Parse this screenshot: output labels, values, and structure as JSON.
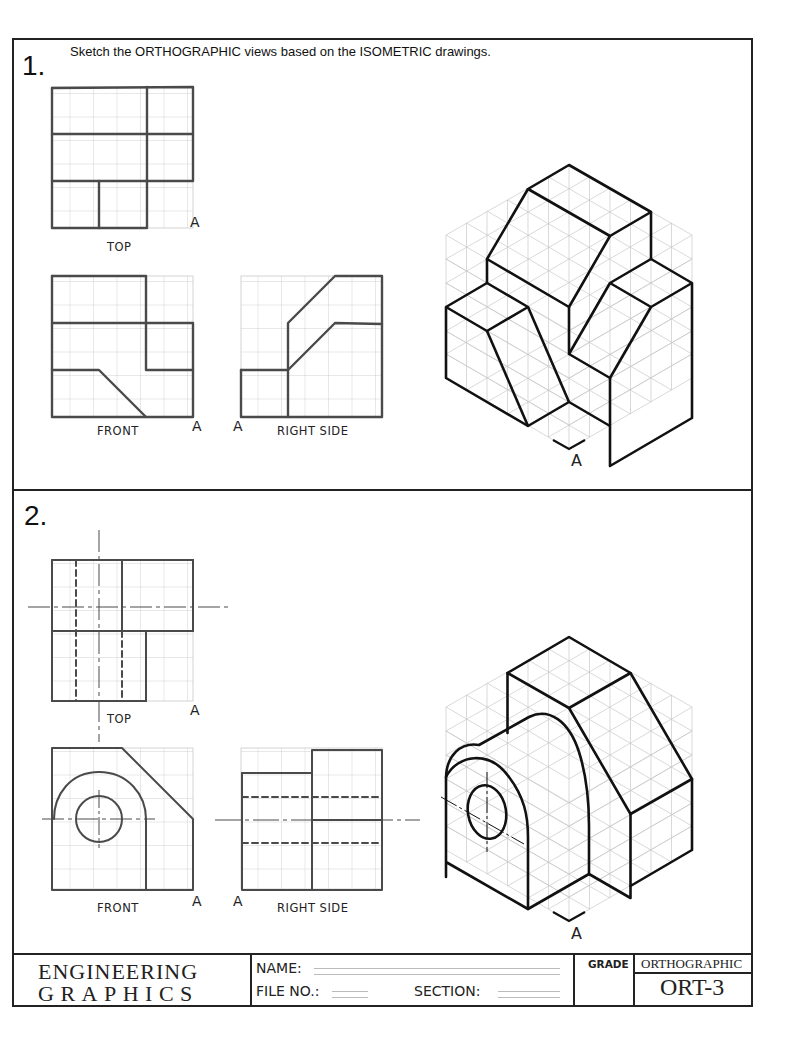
{
  "worksheet": {
    "instructions": "Sketch the ORTHOGRAPHIC views  based on the ISOMETRIC drawings.",
    "problems": [
      {
        "number": "1.",
        "views": {
          "top_label": "TOP",
          "front_label": "FRONT",
          "right_label": "RIGHT SIDE",
          "reference_mark": "A"
        },
        "iso_reference_mark": "A"
      },
      {
        "number": "2.",
        "views": {
          "top_label": "TOP",
          "front_label": "FRONT",
          "right_label": "RIGHT SIDE",
          "reference_mark": "A"
        },
        "iso_reference_mark": "A"
      }
    ]
  },
  "title_block": {
    "brand_line1": "ENGINEERING",
    "brand_line2": "GRAPHICS",
    "name_label": "NAME:",
    "name_value": "",
    "file_no_label": "FILE NO.:",
    "file_no_value": "",
    "section_label": "SECTION:",
    "section_value": "",
    "grade_label": "GRADE",
    "grade_value": "",
    "subject": "ORTHOGRAPHIC",
    "code": "ORT-3"
  },
  "colors": {
    "ink": "#222222",
    "pencil": "#4a4a4a",
    "grid": "#c8c8c8"
  }
}
